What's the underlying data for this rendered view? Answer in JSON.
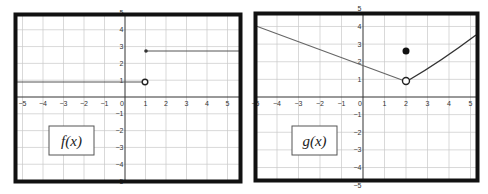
{
  "chart_data": [
    {
      "type": "line",
      "title": "f(x)",
      "label": "f(x)",
      "xlim": [
        -5,
        5
      ],
      "ylim": [
        -5,
        5
      ],
      "x_ticks": [
        -5,
        -4,
        -3,
        -2,
        -1,
        0,
        1,
        2,
        3,
        4,
        5
      ],
      "y_ticks": [
        -5,
        -4,
        -3,
        -2,
        -1,
        1,
        2,
        3,
        4,
        5
      ],
      "grid": true,
      "segments": [
        {
          "from": [
            -5.5,
            1
          ],
          "to": [
            1,
            1
          ],
          "end": "open"
        },
        {
          "from": [
            1,
            3
          ],
          "to": [
            5.5,
            3
          ],
          "start": "closed"
        }
      ],
      "points": [
        {
          "x": 1,
          "y": 1,
          "type": "open"
        },
        {
          "x": 1,
          "y": 3,
          "type": "closed"
        }
      ]
    },
    {
      "type": "line",
      "title": "g(x)",
      "label": "g(x)",
      "xlim": [
        -5,
        5
      ],
      "ylim": [
        -5,
        5
      ],
      "x_ticks": [
        -5,
        -4,
        -3,
        -2,
        -1,
        0,
        1,
        2,
        3,
        4,
        5
      ],
      "y_ticks": [
        -5,
        -4,
        -3,
        -2,
        -1,
        1,
        2,
        3,
        4,
        5
      ],
      "grid": true,
      "segments": [
        {
          "from": [
            -5.5,
            4.75
          ],
          "to": [
            2,
            1
          ],
          "shape": "linear",
          "end": "open"
        },
        {
          "from": [
            2,
            1
          ],
          "to": [
            5.3,
            4
          ],
          "shape": "curve_up"
        }
      ],
      "points": [
        {
          "x": 2,
          "y": 1,
          "type": "open"
        },
        {
          "x": 2,
          "y": 3,
          "type": "closed"
        }
      ]
    }
  ],
  "panels": {
    "left": {
      "label": "f(x)"
    },
    "right": {
      "label": "g(x)"
    }
  }
}
